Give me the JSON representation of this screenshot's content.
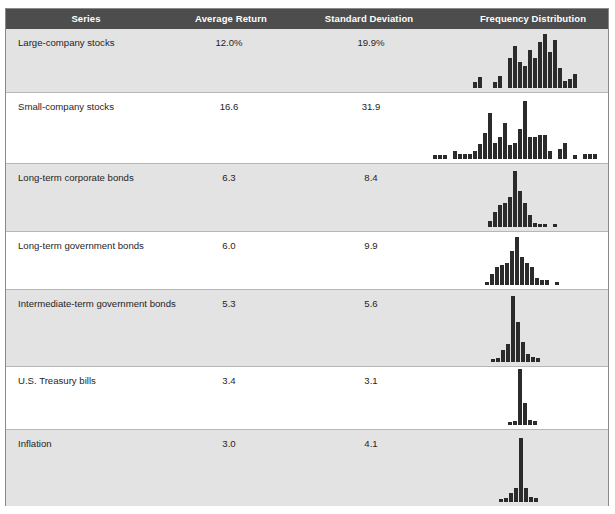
{
  "header": {
    "columns": [
      {
        "key": "series",
        "label": "Series",
        "center": 80
      },
      {
        "key": "avg",
        "label": "Average Return",
        "center": 225
      },
      {
        "key": "sd",
        "label": "Standard Deviation",
        "center": 363
      },
      {
        "key": "freq",
        "label": "Frequency Distribution",
        "center": 527
      }
    ]
  },
  "top_fragment": {
    "text": "· · ··"
  },
  "chart_data": {
    "type": "table",
    "columns": [
      "Series",
      "Average Return",
      "Standard Deviation",
      "Frequency Distribution"
    ],
    "rows": [
      {
        "series": "Large-company stocks",
        "avg_return": "12.0%",
        "std_dev": "19.9%",
        "shaded": true,
        "row_top": 20,
        "row_height": 64,
        "hist": {
          "type": "bar",
          "left": 463,
          "baseline_offset": 4,
          "bar_width": 4,
          "gap": 1,
          "max_px": 48,
          "values": [
            0,
            0,
            6,
            11,
            0,
            0,
            6,
            12,
            0,
            30,
            42,
            26,
            22,
            38,
            30,
            46,
            54,
            36,
            48,
            20,
            7,
            9,
            14,
            0,
            0
          ]
        }
      },
      {
        "series": "Small-company stocks",
        "avg_return": "16.6",
        "std_dev": "31.9",
        "shaded": false,
        "row_top": 84,
        "row_height": 71,
        "hist": {
          "type": "bar",
          "left": 433,
          "baseline_offset": 4,
          "bar_width": 4,
          "gap": 1,
          "max_px": 58,
          "values": [
            4,
            4,
            4,
            0,
            8,
            5,
            5,
            5,
            8,
            15,
            26,
            46,
            16,
            22,
            36,
            14,
            16,
            30,
            58,
            22,
            22,
            24,
            24,
            8,
            0,
            10,
            16,
            0,
            4,
            0,
            5,
            5,
            5
          ]
        }
      },
      {
        "series": "Long-term corporate bonds",
        "avg_return": "6.3",
        "std_dev": "8.4",
        "shaded": true,
        "row_top": 155,
        "row_height": 68,
        "hist": {
          "type": "bar",
          "left": 488,
          "baseline_offset": 4,
          "bar_width": 4,
          "gap": 1,
          "max_px": 56,
          "values": [
            6,
            15,
            22,
            24,
            30,
            56,
            36,
            24,
            12,
            4,
            3,
            3,
            0,
            3
          ]
        }
      },
      {
        "series": "Long-term government bonds",
        "avg_return": "6.0",
        "std_dev": "9.9",
        "shaded": false,
        "row_top": 223,
        "row_height": 58,
        "hist": {
          "type": "bar",
          "left": 485,
          "baseline_offset": 4,
          "bar_width": 4,
          "gap": 1,
          "max_px": 48,
          "values": [
            3,
            11,
            18,
            20,
            22,
            34,
            48,
            28,
            22,
            18,
            7,
            5,
            5,
            0,
            3
          ]
        }
      },
      {
        "series": "Intermediate-term government bonds",
        "avg_return": "5.3",
        "std_dev": "5.6",
        "shaded": true,
        "row_top": 281,
        "row_height": 77,
        "hist": {
          "type": "bar",
          "left": 491,
          "baseline_offset": 4,
          "bar_width": 4,
          "gap": 1,
          "max_px": 66,
          "values": [
            3,
            4,
            12,
            18,
            66,
            40,
            20,
            8,
            5,
            4
          ]
        }
      },
      {
        "series": "U.S. Treasury bills",
        "avg_return": "3.4",
        "std_dev": "3.1",
        "shaded": false,
        "row_top": 358,
        "row_height": 63,
        "hist": {
          "type": "bar",
          "left": 508,
          "baseline_offset": 4,
          "bar_width": 4,
          "gap": 1,
          "max_px": 56,
          "values": [
            3,
            4,
            56,
            22,
            5,
            4
          ]
        }
      },
      {
        "series": "Inflation",
        "avg_return": "3.0",
        "std_dev": "4.1",
        "shaded": true,
        "row_top": 421,
        "row_height": 76,
        "hist": {
          "type": "bar",
          "left": 499,
          "baseline_offset": 4,
          "bar_width": 4,
          "gap": 1,
          "max_px": 64,
          "values": [
            3,
            4,
            9,
            14,
            64,
            14,
            5,
            4
          ]
        }
      }
    ]
  },
  "colors": {
    "header_bg": "#4d4d4d",
    "header_text": "#ffffff",
    "shaded_row": "#e3e3e3",
    "plain_row": "#ffffff",
    "bar": "#2b2b2b",
    "border": "#8a8a8a",
    "row_divider": "#b7b7b7"
  }
}
